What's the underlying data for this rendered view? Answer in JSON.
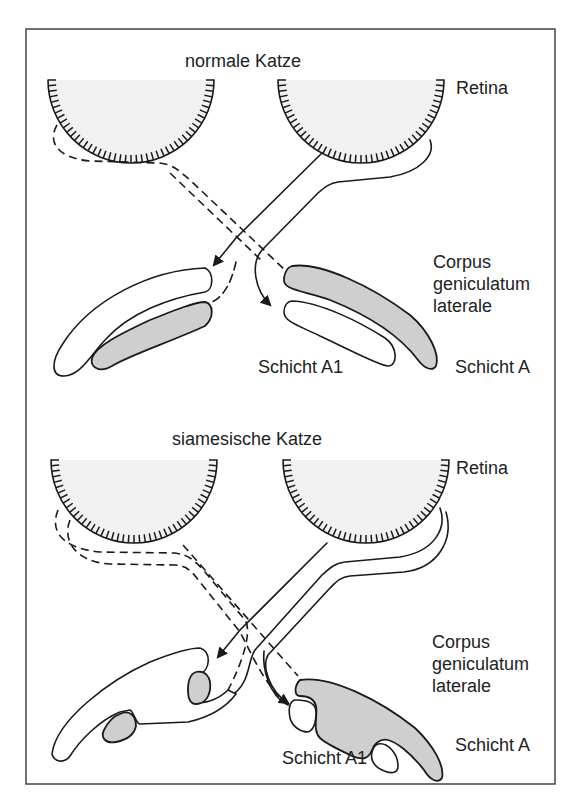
{
  "figure": {
    "panels": [
      {
        "title": "normale Katze",
        "retina_label": "Retina",
        "lgn_label_lines": [
          "Corpus",
          "geniculatum",
          "laterale"
        ],
        "layer_a1_label": "Schicht A1",
        "layer_a_label": "Schicht A"
      },
      {
        "title": "siamesische Katze",
        "retina_label": "Retina",
        "lgn_label_lines": [
          "Corpus",
          "geniculatum",
          "laterale"
        ],
        "layer_a1_label": "Schicht A1",
        "layer_a_label": "Schicht A"
      }
    ],
    "colors": {
      "stroke": "#1a1a1a",
      "retina_fill": "#f1f1f1",
      "layer_gray": "#cfcfcf",
      "frame": "#444444"
    }
  }
}
